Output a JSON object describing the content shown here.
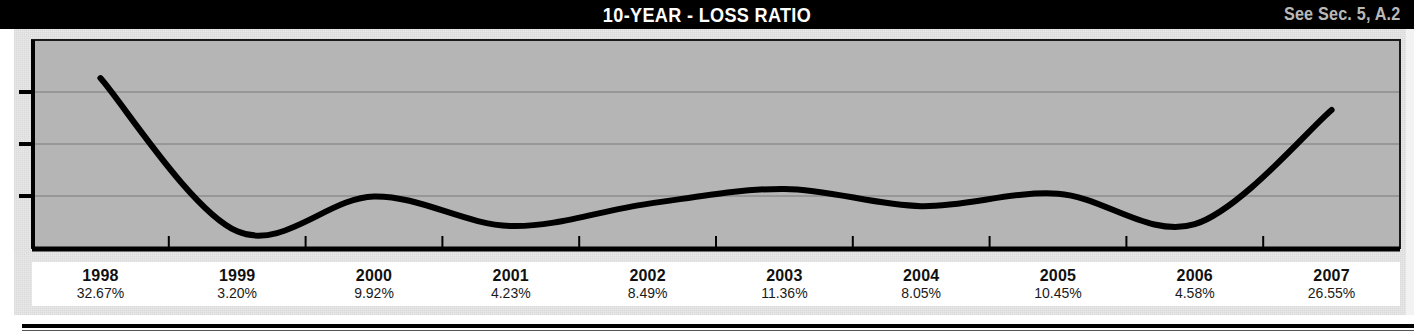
{
  "header": {
    "title": "10-YEAR - LOSS RATIO",
    "reference": "See Sec. 5, A.2",
    "background_color": "#000000",
    "title_color": "#ffffff",
    "reference_color": "#b9b9b9"
  },
  "chart_data": {
    "type": "line",
    "title": "10-YEAR - LOSS RATIO",
    "xlabel": "",
    "ylabel": "",
    "categories": [
      "1998",
      "1999",
      "2000",
      "2001",
      "2002",
      "2003",
      "2004",
      "2005",
      "2006",
      "2007"
    ],
    "values": [
      32.67,
      3.2,
      9.92,
      4.23,
      8.49,
      11.36,
      8.05,
      10.45,
      4.58,
      26.55
    ],
    "value_labels": [
      "32.67%",
      "3.20%",
      "9.92%",
      "4.23%",
      "8.49%",
      "11.36%",
      "8.05%",
      "10.45%",
      "4.58%",
      "26.55%"
    ],
    "ylim": [
      0,
      40
    ],
    "gridlines": [
      10,
      20,
      30
    ],
    "grid": true,
    "legend": "none",
    "line_color": "#000000",
    "line_width": 6,
    "smoothing": "spline",
    "plot_background": "#b5b5b5",
    "axis_color": "#000000"
  },
  "axis_labels": [
    {
      "year": "1998",
      "value": "32.67%"
    },
    {
      "year": "1999",
      "value": "3.20%"
    },
    {
      "year": "2000",
      "value": "9.92%"
    },
    {
      "year": "2001",
      "value": "4.23%"
    },
    {
      "year": "2002",
      "value": "8.49%"
    },
    {
      "year": "2003",
      "value": "11.36%"
    },
    {
      "year": "2004",
      "value": "8.05%"
    },
    {
      "year": "2005",
      "value": "10.45%"
    },
    {
      "year": "2006",
      "value": "4.58%"
    },
    {
      "year": "2007",
      "value": "26.55%"
    }
  ]
}
